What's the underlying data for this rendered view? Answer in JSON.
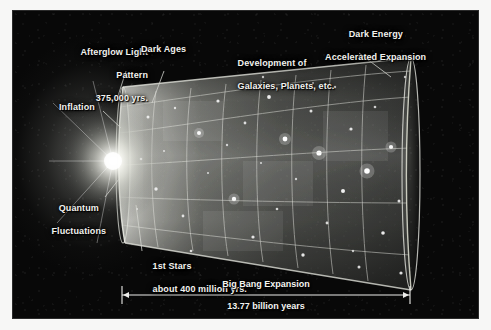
{
  "figure": {
    "title_alt": "Timeline of the Universe",
    "background_color": "#080808",
    "text_color": "#f2f2ee",
    "frame_color": "#2b2b2b"
  },
  "labels": {
    "afterglow": {
      "line1": "Afterglow Light",
      "line2": "Pattern",
      "line3": "375,000 yrs."
    },
    "dark_ages": "Dark Ages",
    "development": {
      "line1": "Development of",
      "line2": "Galaxies, Planets, etc."
    },
    "dark_energy": {
      "line1": "Dark Energy",
      "line2": "Accelerated Expansion"
    },
    "inflation": "Inflation",
    "quantum": {
      "line1": "Quantum",
      "line2": "Fluctuations"
    },
    "first_stars": {
      "line1": "1st Stars",
      "line2": "about 400 million yrs."
    }
  },
  "timeline": {
    "title": "Big Bang Expansion",
    "duration": "13.77 billion years",
    "start_x": 122,
    "end_x": 410
  }
}
